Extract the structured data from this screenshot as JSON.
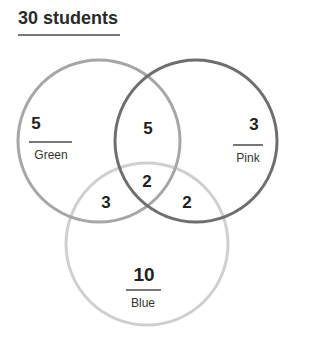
{
  "title": "30 students",
  "sets": [
    {
      "name": "Green",
      "only": "5",
      "stroke": "#a6a6a6"
    },
    {
      "name": "Pink",
      "only": "3",
      "stroke": "#6e6e6e"
    },
    {
      "name": "Blue",
      "only": "10",
      "stroke": "#cfcfcf"
    }
  ],
  "intersections": {
    "green_pink": "5",
    "green_blue": "3",
    "pink_blue": "2",
    "all_three": "2"
  }
}
